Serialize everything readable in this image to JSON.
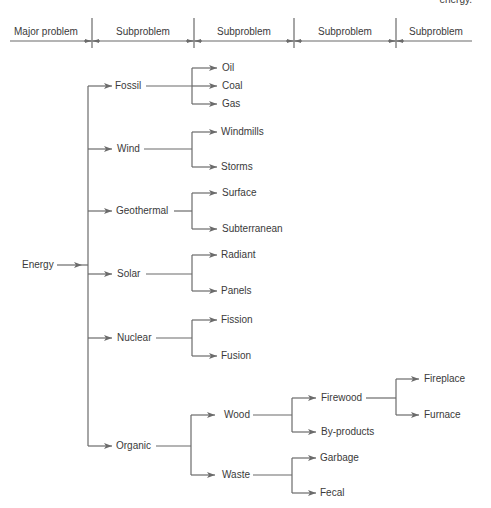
{
  "caption_fragment": "energy.",
  "header": {
    "columns": [
      {
        "label": "Major problem",
        "x_center": 46
      },
      {
        "label": "Subproblem",
        "x_center": 143
      },
      {
        "label": "Subproblem",
        "x_center": 244
      },
      {
        "label": "Subproblem",
        "x_center": 345
      },
      {
        "label": "Subproblem",
        "x_center": 433
      }
    ]
  },
  "tree": {
    "root": {
      "label": "Energy"
    },
    "level1": [
      {
        "label": "Fossil"
      },
      {
        "label": "Wind"
      },
      {
        "label": "Geothermal"
      },
      {
        "label": "Solar"
      },
      {
        "label": "Nuclear"
      },
      {
        "label": "Organic"
      }
    ],
    "level2": {
      "fossil": [
        {
          "label": "Oil"
        },
        {
          "label": "Coal"
        },
        {
          "label": "Gas"
        }
      ],
      "wind": [
        {
          "label": "Windmills"
        },
        {
          "label": "Storms"
        }
      ],
      "geothermal": [
        {
          "label": "Surface"
        },
        {
          "label": "Subterranean"
        }
      ],
      "solar": [
        {
          "label": "Radiant"
        },
        {
          "label": "Panels"
        }
      ],
      "nuclear": [
        {
          "label": "Fission"
        },
        {
          "label": "Fusion"
        }
      ],
      "organic": [
        {
          "label": "Wood"
        },
        {
          "label": "Waste"
        }
      ]
    },
    "level3": {
      "wood": [
        {
          "label": "Firewood"
        },
        {
          "label": "By-products"
        }
      ],
      "waste": [
        {
          "label": "Garbage"
        },
        {
          "label": "Fecal"
        }
      ]
    },
    "level4": {
      "firewood": [
        {
          "label": "Fireplace"
        },
        {
          "label": "Furnace"
        }
      ]
    }
  },
  "colors": {
    "line": "#6b6b6b",
    "text": "#3a3a3a",
    "background": "#ffffff"
  }
}
